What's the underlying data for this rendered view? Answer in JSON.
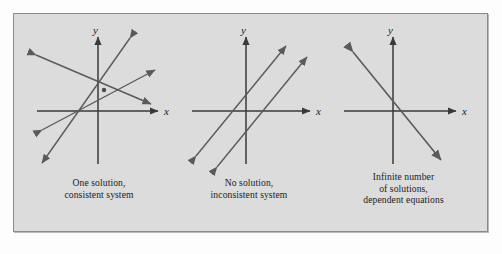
{
  "figure": {
    "background_color": "#dcdcdc",
    "page_color": "#fdfdfd",
    "border_color": "#8a8a8a",
    "line_color": "#555555",
    "axis_color": "#3a3a3a",
    "text_color": "#1b1b1b",
    "panels": [
      {
        "id": "one-solution",
        "axis_x_label": "x",
        "axis_y_label": "y",
        "caption_lines": [
          "One solution,",
          "consistent system"
        ],
        "case": "intersecting-lines",
        "line_count": 2,
        "intersection_point_shown": true
      },
      {
        "id": "no-solution",
        "axis_x_label": "x",
        "axis_y_label": "y",
        "caption_lines": [
          "No solution,",
          "inconsistent system"
        ],
        "case": "parallel-lines",
        "line_count": 2,
        "intersection_point_shown": false
      },
      {
        "id": "infinite-solutions",
        "axis_x_label": "x",
        "axis_y_label": "y",
        "caption_lines": [
          "Infinite number",
          "of solutions,",
          "dependent equations"
        ],
        "case": "coincident-lines",
        "line_count": 1,
        "intersection_point_shown": false
      }
    ]
  }
}
